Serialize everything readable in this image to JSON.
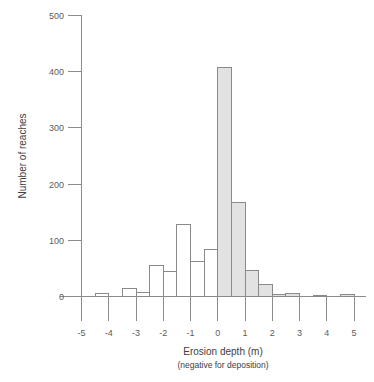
{
  "chart_data": {
    "type": "bar",
    "title": "",
    "xlabel": "Erosion depth (m)",
    "xlabel_sub": "(negative for deposition)",
    "ylabel": "Number of reaches",
    "xlim": [
      -5,
      5
    ],
    "ylim": [
      0,
      500
    ],
    "bin_width": 0.5,
    "grid": false,
    "legend": null,
    "xticks": [
      "-5",
      "-4",
      "-3",
      "-2",
      "-1",
      "0",
      "1",
      "2",
      "3",
      "4",
      "5"
    ],
    "xtick_values": [
      -5,
      -4,
      -3,
      -2,
      -1,
      0,
      1,
      2,
      3,
      4,
      5
    ],
    "yticks": [
      "0",
      "100",
      "200",
      "300",
      "400",
      "500"
    ],
    "ytick_values": [
      0,
      100,
      200,
      300,
      400,
      500
    ],
    "bin_starts": [
      -5,
      -4.5,
      -4,
      -3.5,
      -3,
      -2.5,
      -2,
      -1.5,
      -1,
      -0.5,
      0,
      0.5,
      1,
      1.5,
      2,
      2.5,
      3,
      3.5,
      4,
      4.5
    ],
    "bin_labels": [
      "-5 to -4.5",
      "-4.5 to -4",
      "-4 to -3.5",
      "-3.5 to -3",
      "-3 to -2.5",
      "-2.5 to -2",
      "-2 to -1.5",
      "-1.5 to -1",
      "-1 to -0.5",
      "-0.5 to 0",
      "0 to 0.5",
      "0.5 to 1",
      "1 to 1.5",
      "1.5 to 2",
      "2 to 2.5",
      "2.5 to 3",
      "3 to 3.5",
      "3.5 to 4",
      "4 to 4.5",
      "4.5 to 5"
    ],
    "values": [
      0,
      6,
      0,
      14,
      8,
      55,
      45,
      128,
      62,
      84,
      408,
      167,
      47,
      22,
      3,
      6,
      0,
      2,
      0,
      3
    ],
    "filled_from": 0,
    "fill_color": "#e2e2e2",
    "outline_color": "#8a8a8a",
    "note_filled": "bars at and above 0 m are shaded grey; bars below 0 m are unfilled"
  }
}
